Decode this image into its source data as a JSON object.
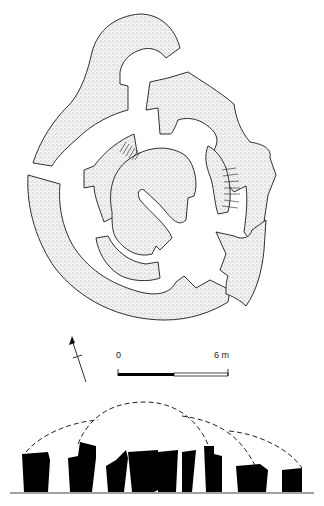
{
  "figure": {
    "type": "archaeological site plan and elevation",
    "plan": {
      "description": "Plan of concentric curved stone-walled enclosure with stippled wall fill",
      "wall_fill_color": "#e6e6e6",
      "outline_color": "#1a1a1a"
    },
    "north_arrow": {
      "icon": "north-arrow-icon"
    },
    "scale_bar": {
      "start_label": "0",
      "end_label": "6 m",
      "filled_color": "#000000",
      "open_color": "#ffffff"
    },
    "elevation": {
      "description": "Elevation of standing stones (black silhouettes) with dashed reconstructed arches",
      "stone_color": "#000000",
      "ground_line_color": "#444444",
      "arch_style": "dashed"
    }
  }
}
